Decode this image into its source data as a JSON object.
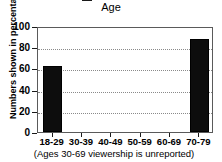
{
  "chart_data": {
    "type": "bar",
    "title": "Age",
    "xlabel": "",
    "ylabel": "Numbers shown in percentages",
    "categories": [
      "18-29",
      "30-39",
      "40-49",
      "50-59",
      "60-69",
      "70-79"
    ],
    "values": [
      62,
      null,
      null,
      null,
      null,
      88
    ],
    "series": [
      {
        "name": "viewership",
        "values": [
          62,
          null,
          null,
          null,
          null,
          88
        ]
      }
    ],
    "ylim": [
      0,
      100
    ],
    "yticks": [
      0,
      20,
      40,
      60,
      80,
      100
    ],
    "ytick_labels": [
      "0",
      "20",
      "40",
      "60",
      "80",
      "100"
    ],
    "grid": true,
    "grid_axis": "y",
    "grid_style": "dotted",
    "legend": false,
    "legend_position": "none",
    "annotation": "(Ages 30-69 viewership is unreported)",
    "bar_color": "#0d0d0d",
    "note": "Bars for ages 30-69 are absent (unreported)"
  },
  "figure": {
    "title": "Age",
    "footnote": "(Ages 30-69 viewership is unreported)",
    "ylabel": "Numbers shown in percentages",
    "colors": {
      "bar": "#0d0d0d",
      "axis": "#1a1a1a",
      "grid": "#8a8a8a",
      "background": "#ffffff"
    }
  }
}
